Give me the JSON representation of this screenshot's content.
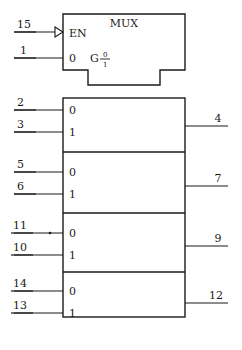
{
  "diagram": {
    "title": "MUX",
    "control_block": {
      "enable_label": "EN",
      "enable_pin": "15",
      "enable_marker": "negation-triangle-icon",
      "select_label": "0",
      "select_pin": "1",
      "common_control_label": "G",
      "common_control_numerator": "0",
      "common_control_denominator": "1"
    },
    "sections": [
      {
        "input_0_label": "0",
        "input_0_pin": "2",
        "input_1_label": "1",
        "input_1_pin": "3",
        "output_pin": "4",
        "input_0_marker": false
      },
      {
        "input_0_label": "0",
        "input_0_pin": "5",
        "input_1_label": "1",
        "input_1_pin": "6",
        "output_pin": "7",
        "input_0_marker": false
      },
      {
        "input_0_label": "0",
        "input_0_pin": "11",
        "input_1_label": "1",
        "input_1_pin": "10",
        "output_pin": "9",
        "input_0_marker": true
      },
      {
        "input_0_label": "0",
        "input_0_pin": "14",
        "input_1_label": "1",
        "input_1_pin": "13",
        "output_pin": "12",
        "input_0_marker": false
      }
    ]
  },
  "colors": {
    "line": "#1a1a1a",
    "text": "#1a1a1a",
    "background": "#ffffff"
  }
}
